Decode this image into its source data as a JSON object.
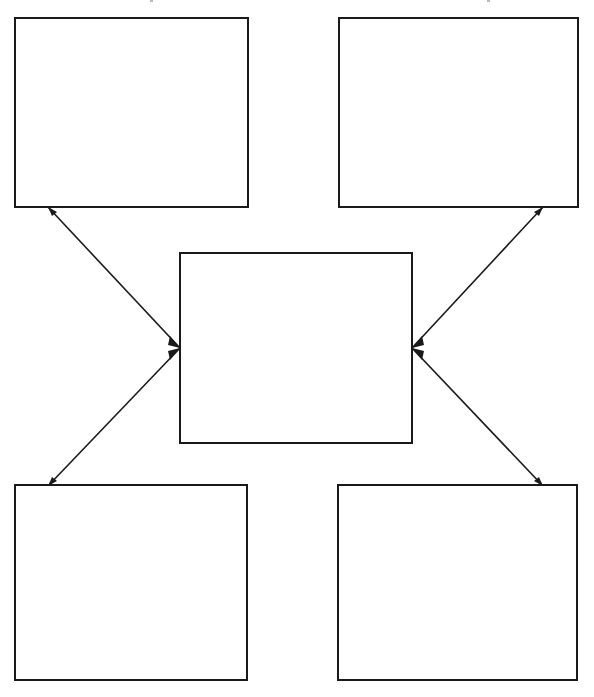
{
  "page": {
    "width": 594,
    "height": 697,
    "background_color": "#ffffff",
    "stroke_color": "#1a1a1a"
  },
  "diagram": {
    "type": "concept-map",
    "layout": "center-with-four-corners",
    "node_count": 5,
    "connector_count": 4,
    "nodes": [
      {
        "id": "top-left",
        "label": "",
        "x": 15,
        "y": 18,
        "width": 233,
        "height": 189
      },
      {
        "id": "top-right",
        "label": "",
        "x": 339,
        "y": 18,
        "width": 239,
        "height": 189
      },
      {
        "id": "center",
        "label": "",
        "x": 180,
        "y": 253,
        "width": 232,
        "height": 190
      },
      {
        "id": "bottom-left",
        "label": "",
        "x": 15,
        "y": 485,
        "width": 232,
        "height": 195
      },
      {
        "id": "bottom-right",
        "label": "",
        "x": 338,
        "y": 485,
        "width": 239,
        "height": 195
      }
    ],
    "connectors": [
      {
        "id": "center-to-top-left",
        "from": "center",
        "to": "top-left",
        "from_x": 180,
        "from_y": 348,
        "to_x": 48,
        "to_y": 207,
        "arrow_at": "both"
      },
      {
        "id": "center-to-top-right",
        "from": "center",
        "to": "top-right",
        "from_x": 412,
        "from_y": 348,
        "to_x": 543,
        "to_y": 207,
        "arrow_at": "both"
      },
      {
        "id": "center-to-bottom-left",
        "from": "center",
        "to": "bottom-left",
        "from_x": 180,
        "from_y": 348,
        "to_x": 48,
        "to_y": 486,
        "arrow_at": "both"
      },
      {
        "id": "center-to-bottom-right",
        "from": "center",
        "to": "bottom-right",
        "from_x": 412,
        "from_y": 348,
        "to_x": 543,
        "to_y": 486,
        "arrow_at": "both"
      }
    ]
  }
}
